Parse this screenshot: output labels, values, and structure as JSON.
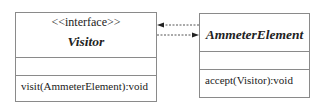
{
  "diagram": {
    "type": "uml-class",
    "classes": [
      {
        "id": "visitor",
        "stereotype": "<<interface>>",
        "name": "Visitor",
        "attributes": [],
        "operations": [
          "visit(AmmeterElement):void"
        ]
      },
      {
        "id": "ammeter-element",
        "stereotype": "",
        "name": "AmmeterElement",
        "attributes": [],
        "operations": [
          "accept(Visitor):void"
        ]
      }
    ],
    "relationships": [
      {
        "from": "ammeter-element",
        "to": "visitor",
        "style": "dashed",
        "arrow": "filled"
      },
      {
        "from": "visitor",
        "to": "ammeter-element",
        "style": "dashed",
        "arrow": "filled"
      }
    ],
    "colors": {
      "line": "#8a8a8a",
      "arrow": "#333333",
      "text": "#222222"
    }
  }
}
